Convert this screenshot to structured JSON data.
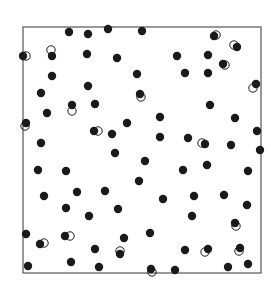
{
  "chart_data": {
    "type": "scatter",
    "title": "",
    "xlabel": "",
    "ylabel": "",
    "grid": false,
    "legend": null,
    "frame": {
      "left": 23,
      "top": 27,
      "right": 261,
      "bottom": 273,
      "color": "#555555"
    },
    "xlim": [
      0,
      1
    ],
    "ylim": [
      0,
      1
    ],
    "series": [
      {
        "name": "filled",
        "marker": "filled-circle",
        "color": "#1a1a1a",
        "radius": 4.2,
        "points_px": [
          [
            69,
            32
          ],
          [
            88,
            34
          ],
          [
            108,
            29
          ],
          [
            142,
            31
          ],
          [
            214,
            36
          ],
          [
            237,
            47
          ],
          [
            23,
            56
          ],
          [
            52,
            56
          ],
          [
            87,
            54
          ],
          [
            117,
            58
          ],
          [
            177,
            56
          ],
          [
            208,
            55
          ],
          [
            223,
            64
          ],
          [
            52,
            76
          ],
          [
            137,
            74
          ],
          [
            185,
            73
          ],
          [
            208,
            73
          ],
          [
            256,
            84
          ],
          [
            41,
            93
          ],
          [
            88,
            86
          ],
          [
            140,
            94
          ],
          [
            72,
            105
          ],
          [
            95,
            104
          ],
          [
            47,
            113
          ],
          [
            210,
            105
          ],
          [
            160,
            117
          ],
          [
            235,
            118
          ],
          [
            26,
            123
          ],
          [
            127,
            123
          ],
          [
            94,
            131
          ],
          [
            112,
            134
          ],
          [
            160,
            137
          ],
          [
            188,
            138
          ],
          [
            205,
            144
          ],
          [
            231,
            145
          ],
          [
            257,
            131
          ],
          [
            41,
            143
          ],
          [
            115,
            153
          ],
          [
            145,
            161
          ],
          [
            260,
            150
          ],
          [
            38,
            170
          ],
          [
            66,
            171
          ],
          [
            183,
            170
          ],
          [
            207,
            165
          ],
          [
            248,
            171
          ],
          [
            139,
            181
          ],
          [
            44,
            196
          ],
          [
            77,
            192
          ],
          [
            105,
            191
          ],
          [
            163,
            199
          ],
          [
            194,
            196
          ],
          [
            224,
            195
          ],
          [
            247,
            205
          ],
          [
            66,
            208
          ],
          [
            118,
            209
          ],
          [
            89,
            216
          ],
          [
            192,
            216
          ],
          [
            235,
            223
          ],
          [
            26,
            234
          ],
          [
            65,
            236
          ],
          [
            124,
            238
          ],
          [
            150,
            233
          ],
          [
            40,
            244
          ],
          [
            95,
            249
          ],
          [
            120,
            254
          ],
          [
            185,
            250
          ],
          [
            208,
            249
          ],
          [
            240,
            248
          ],
          [
            28,
            266
          ],
          [
            71,
            262
          ],
          [
            99,
            267
          ],
          [
            151,
            269
          ],
          [
            175,
            270
          ],
          [
            228,
            267
          ],
          [
            248,
            264
          ]
        ]
      },
      {
        "name": "hollow",
        "marker": "open-circle",
        "color": "#1a1a1a",
        "radius": 4.2,
        "points_px": [
          [
            216,
            35
          ],
          [
            234,
            45
          ],
          [
            26,
            56
          ],
          [
            51,
            50
          ],
          [
            225,
            65
          ],
          [
            253,
            88
          ],
          [
            141,
            97
          ],
          [
            72,
            111
          ],
          [
            25,
            126
          ],
          [
            98,
            131
          ],
          [
            202,
            143
          ],
          [
            236,
            226
          ],
          [
            70,
            236
          ],
          [
            44,
            243
          ],
          [
            120,
            251
          ],
          [
            205,
            252
          ],
          [
            239,
            251
          ],
          [
            152,
            272
          ]
        ]
      }
    ]
  }
}
